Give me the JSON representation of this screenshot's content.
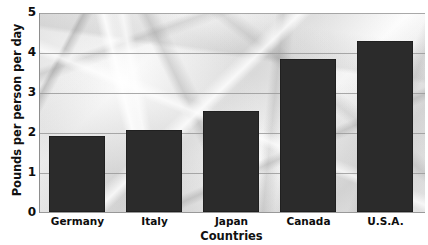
{
  "chart_data": {
    "type": "bar",
    "title": "",
    "xlabel": "Countries",
    "ylabel": "Pounds per person per day",
    "categories": [
      "Germany",
      "Italy",
      "Japan",
      "Canada",
      "U.S.A."
    ],
    "values": [
      1.9,
      2.05,
      2.55,
      3.85,
      4.3
    ],
    "ylim": [
      0,
      5
    ],
    "yticks": [
      0,
      1,
      2,
      3,
      4,
      5
    ],
    "ytick_labels": [
      "0",
      "1",
      "2",
      "3",
      "4",
      "5"
    ],
    "grid": true,
    "legend": "none",
    "bar_color": "#2b2b2b",
    "gridline_color": "#9a9a9a",
    "axis_color": "#8d8d8d",
    "background": "crumpled-paper-grayscale-photo"
  }
}
